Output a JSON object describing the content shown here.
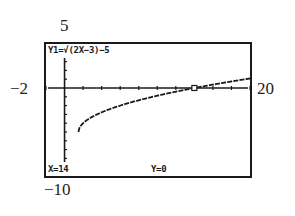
{
  "window": {
    "xmin_label": "−2",
    "xmax_label": "20",
    "ymin_label": "−10",
    "ymax_label": "5"
  },
  "screen": {
    "equation": "Y1=√(2X−3)−5",
    "x_readout": "X=14",
    "y_readout": "Y=0"
  },
  "colors": {
    "ink": "#1a1a1a",
    "background": "#ffffff"
  },
  "chart_data": {
    "type": "line",
    "title": "Y1=√(2X−3)−5",
    "xlabel": "",
    "ylabel": "",
    "xlim": [
      -2,
      20
    ],
    "ylim": [
      -10,
      5
    ],
    "xscale": 2,
    "yscale": 1,
    "grid": false,
    "legend": "none",
    "series": [
      {
        "name": "Y1",
        "expression": "sqrt(2x-3)-5",
        "x": [
          1.5,
          2,
          3,
          4,
          5,
          6,
          8,
          10,
          12,
          14,
          16,
          18,
          20
        ],
        "y": [
          -5.0,
          -4.0,
          -3.27,
          -2.76,
          -2.35,
          -2.0,
          -1.39,
          -0.84,
          -0.36,
          0.0,
          0.39,
          0.74,
          1.08
        ]
      }
    ],
    "trace_point": {
      "x": 14,
      "y": 0
    },
    "annotations": [
      "X=14",
      "Y=0"
    ]
  }
}
